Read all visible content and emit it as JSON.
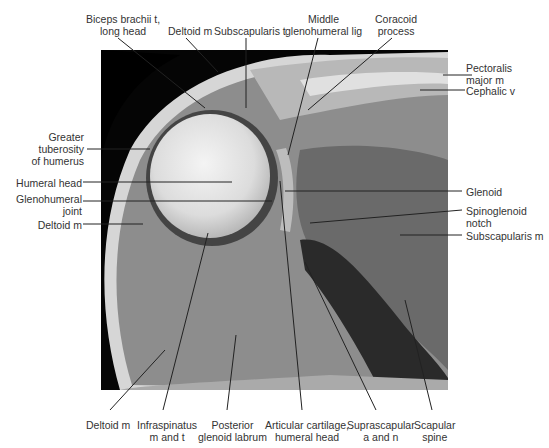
{
  "figure": {
    "type": "axial MRI of shoulder (T1-weighted), anatomical labeling",
    "colors": {
      "background": "#ffffff",
      "label_text": "#333333",
      "leader_line": "#222222"
    }
  },
  "labels": {
    "top": [
      {
        "id": "biceps",
        "line1": "Biceps brachii t,",
        "line2": "long head"
      },
      {
        "id": "deltoid_top",
        "line1": "Deltoid m"
      },
      {
        "id": "subscap_t",
        "line1": "Subscapularis t"
      },
      {
        "id": "mghl",
        "line1": "Middle",
        "line2": "glenohumeral lig"
      },
      {
        "id": "coracoid",
        "line1": "Coracoid",
        "line2": "process"
      }
    ],
    "left": [
      {
        "id": "greater_tub",
        "line1": "Greater",
        "line2": "tuberosity",
        "line3": "of humerus"
      },
      {
        "id": "humeral_head",
        "line1": "Humeral head"
      },
      {
        "id": "gh_joint",
        "line1": "Glenohumeral",
        "line2": "joint"
      },
      {
        "id": "deltoid_left",
        "line1": "Deltoid m"
      }
    ],
    "right": [
      {
        "id": "pectoralis",
        "line1": "Pectoralis",
        "line2": "major m"
      },
      {
        "id": "cephalic",
        "line1": "Cephalic v"
      },
      {
        "id": "glenoid",
        "line1": "Glenoid"
      },
      {
        "id": "spinoglenoid",
        "line1": "Spinoglenoid",
        "line2": "notch"
      },
      {
        "id": "subscap_m",
        "line1": "Subscapularis m"
      }
    ],
    "bottom": [
      {
        "id": "deltoid_bottom",
        "line1": "Deltoid m"
      },
      {
        "id": "infraspinatus",
        "line1": "Infraspinatus",
        "line2": "m and t"
      },
      {
        "id": "post_labrum",
        "line1": "Posterior",
        "line2": "glenoid labrum"
      },
      {
        "id": "artic_cart",
        "line1": "Articular cartilage,",
        "line2": "humeral head"
      },
      {
        "id": "suprascap",
        "line1": "Suprascapular",
        "line2": "a and n"
      },
      {
        "id": "scap_spine",
        "line1": "Scapular",
        "line2": "spine"
      }
    ]
  }
}
